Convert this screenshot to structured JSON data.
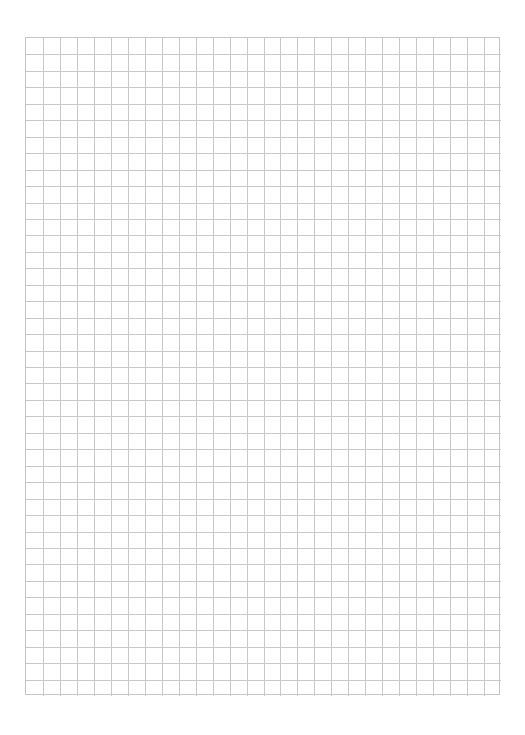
{
  "page": {
    "type": "graph-paper",
    "background_color": "#ffffff",
    "line_color": "#c8c8c8"
  },
  "grid": {
    "columns": 28,
    "rows": 40,
    "left": 25,
    "top": 37,
    "width": 475,
    "height": 658
  }
}
